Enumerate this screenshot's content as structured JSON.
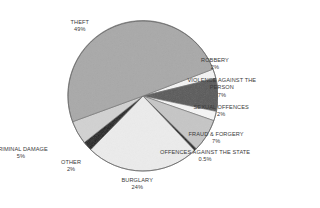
{
  "chart_data": {
    "type": "pie",
    "title": "",
    "start_angle_deg": -21,
    "center": [
      143,
      96
    ],
    "radius": 75,
    "slices": [
      {
        "label": "ROBBERY",
        "value": 2,
        "value_label": "2%",
        "color": "#f4f4f4"
      },
      {
        "label": "VIOLENCE AGAINST THE PERSON",
        "value": 7,
        "value_label": "7%",
        "color": "#5a5a5a"
      },
      {
        "label": "SEXUAL OFFENCES",
        "value": 2,
        "value_label": "2%",
        "color": "#f6f6f6"
      },
      {
        "label": "FRAUD & FORGERY",
        "value": 7,
        "value_label": "7%",
        "color": "#c6c6c6"
      },
      {
        "label": "OFFENCES AGAINST THE STATE",
        "value": 0.5,
        "value_label": "0.5%",
        "color": "#1e1e1e"
      },
      {
        "label": "BURGLARY",
        "value": 24,
        "value_label": "24%",
        "color": "#ececec"
      },
      {
        "label": "OTHER",
        "value": 2,
        "value_label": "2%",
        "color": "#222222"
      },
      {
        "label": "CRIMINAL DAMAGE",
        "value": 5,
        "value_label": "5%",
        "color": "#d2d2d2"
      },
      {
        "label": "THEFT",
        "value": 49,
        "value_label": "49%",
        "color": "#a9a9a9"
      }
    ],
    "legend": "none"
  },
  "labels": [
    {
      "name": "label-theft",
      "lines": [
        "THEFT",
        "49%"
      ],
      "x": 80,
      "y": 19,
      "align": "center"
    },
    {
      "name": "label-robbery",
      "lines": [
        "ROBBERY",
        "2%"
      ],
      "x": 215,
      "y": 57,
      "align": "center"
    },
    {
      "name": "label-violence",
      "lines": [
        "VIOLENCE AGAINST THE",
        "PERSON",
        "7%"
      ],
      "x": 222,
      "y": 77,
      "align": "center"
    },
    {
      "name": "label-sexual-offences",
      "lines": [
        "SEXUAL OFFENCES",
        "2%"
      ],
      "x": 221,
      "y": 104,
      "align": "center"
    },
    {
      "name": "label-fraud-forgery",
      "lines": [
        "FRAUD & FORGERY",
        "7%"
      ],
      "x": 216,
      "y": 131,
      "align": "center"
    },
    {
      "name": "label-offences-state",
      "lines": [
        "OFFENCES AGAINST THE STATE",
        "0.5%"
      ],
      "x": 205,
      "y": 149,
      "align": "center"
    },
    {
      "name": "label-burglary",
      "lines": [
        "BURGLARY",
        "24%"
      ],
      "x": 137,
      "y": 177,
      "align": "center"
    },
    {
      "name": "label-criminal-damage",
      "lines": [
        "CRIMINAL DAMAGE",
        "5%"
      ],
      "x": 21,
      "y": 146,
      "align": "center"
    },
    {
      "name": "label-other",
      "lines": [
        "OTHER",
        "2%"
      ],
      "x": 71,
      "y": 159,
      "align": "center"
    }
  ]
}
